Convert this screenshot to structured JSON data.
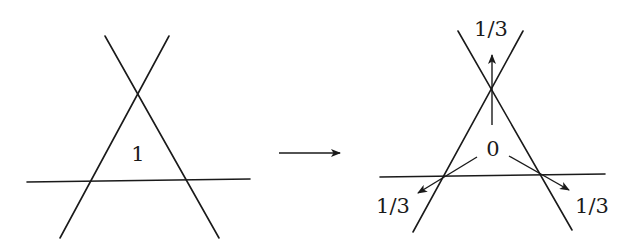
{
  "diagram": {
    "left": {
      "center_label": "1",
      "lines": [
        {
          "x1": 105,
          "y1": 36,
          "x2": 219,
          "y2": 238
        },
        {
          "x1": 169,
          "y1": 36,
          "x2": 60,
          "y2": 238
        },
        {
          "x1": 27,
          "y1": 182,
          "x2": 250,
          "y2": 179
        }
      ],
      "label_pos": {
        "x": 138,
        "y": 161
      }
    },
    "transition_arrow": {
      "x1": 279,
      "y1": 153,
      "x2": 340,
      "y2": 153
    },
    "right": {
      "center_label": "0",
      "lines": [
        {
          "x1": 458,
          "y1": 31,
          "x2": 572,
          "y2": 230
        },
        {
          "x1": 523,
          "y1": 31,
          "x2": 413,
          "y2": 232
        },
        {
          "x1": 380,
          "y1": 177,
          "x2": 605,
          "y2": 174
        }
      ],
      "label_pos": {
        "x": 493,
        "y": 155
      },
      "vertex_labels": [
        {
          "text": "1/3",
          "x": 491,
          "y": 36,
          "position": "top"
        },
        {
          "text": "1/3",
          "x": 393,
          "y": 209,
          "position": "bottom-left"
        },
        {
          "text": "1/3",
          "x": 592,
          "y": 209,
          "position": "bottom-right"
        }
      ],
      "arrows": [
        {
          "x1": 492,
          "y1": 125,
          "x2": 492,
          "y2": 55,
          "direction": "up"
        },
        {
          "x1": 477,
          "y1": 157,
          "x2": 418,
          "y2": 193,
          "direction": "down-left"
        },
        {
          "x1": 509,
          "y1": 156,
          "x2": 569,
          "y2": 190,
          "direction": "down-right"
        }
      ]
    },
    "labels": {
      "left_value": "1",
      "right_value": "0",
      "top_fraction": "1/3",
      "bottom_left_fraction": "1/3",
      "bottom_right_fraction": "1/3"
    }
  }
}
